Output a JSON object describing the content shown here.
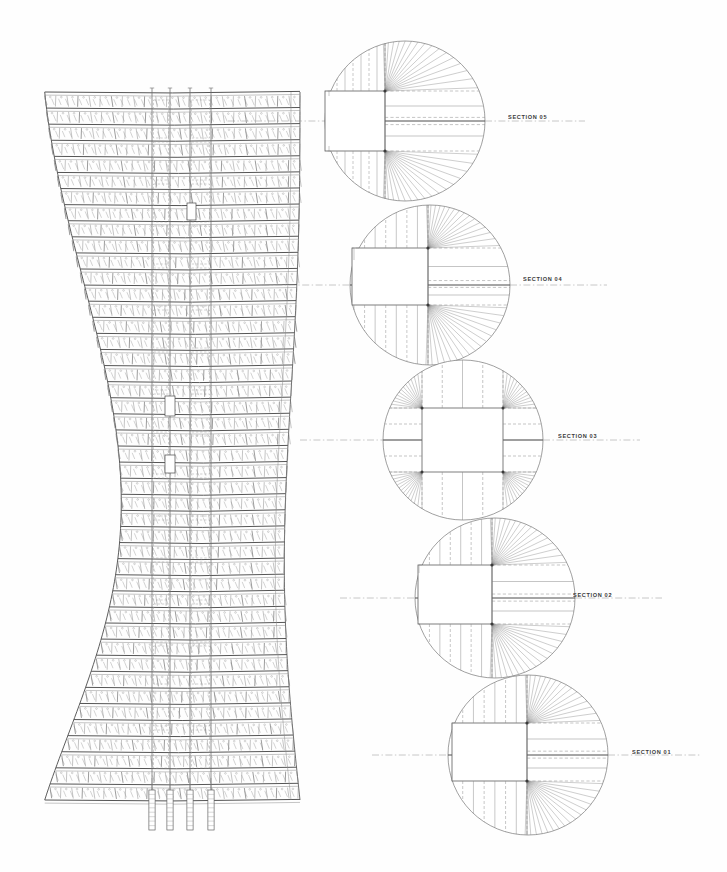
{
  "sheet": {
    "title": "Tower Structural Elevation and Floor Plan Sections",
    "background_color": "#fefefe",
    "ink_color": "#6e6e6e",
    "label_color": "#3a3a3a",
    "width": 727,
    "height": 872
  },
  "elevation": {
    "name": "Curved Tower Elevation",
    "left_edge_x": 40,
    "right_edge_x": 300,
    "top_y": 92,
    "bottom_y": 800,
    "floor_count": 45,
    "core_lines": [
      {
        "x": 152,
        "label_tick": true
      },
      {
        "x": 170,
        "label_tick": true
      },
      {
        "x": 190,
        "label_tick": true
      },
      {
        "x": 211,
        "label_tick": true
      }
    ],
    "core_tick_top_y": 790,
    "core_tick_bottom_y": 830,
    "profile_note": "S-curve facade, waist near mid-height"
  },
  "sections": [
    {
      "id": "section-05",
      "label": "SECTION 05",
      "cx": 405,
      "cy": 121,
      "r": 80,
      "label_x": 508,
      "label_y": 114,
      "centerline_x1": 228,
      "centerline_x2": 585,
      "type": "asymmetric",
      "nodes": [
        {
          "x": 385,
          "y": 91
        },
        {
          "x": 385,
          "y": 151
        }
      ],
      "core_rect": {
        "x1": 325,
        "y1": 91,
        "x2": 470,
        "y2": 151
      },
      "fan_count": 15
    },
    {
      "id": "section-04",
      "label": "SECTION 04",
      "cx": 430,
      "cy": 285,
      "r": 80,
      "label_x": 523,
      "label_y": 276,
      "centerline_x1": 262,
      "centerline_x2": 607,
      "type": "asymmetric",
      "nodes": [
        {
          "x": 428,
          "y": 248
        },
        {
          "x": 428,
          "y": 305
        }
      ],
      "core_rect": {
        "x1": 352,
        "y1": 248,
        "x2": 500,
        "y2": 305
      },
      "fan_count": 15
    },
    {
      "id": "section-03",
      "label": "SECTION 03",
      "cx": 463,
      "cy": 440,
      "r": 80,
      "label_x": 558,
      "label_y": 433,
      "centerline_x1": 300,
      "centerline_x2": 640,
      "type": "symmetric",
      "nodes": [
        {
          "x": 422,
          "y": 408
        },
        {
          "x": 503,
          "y": 408
        },
        {
          "x": 422,
          "y": 472
        },
        {
          "x": 503,
          "y": 472
        }
      ],
      "core_rect": {
        "x1": 422,
        "y1": 408,
        "x2": 503,
        "y2": 472
      },
      "fan_count": 13
    },
    {
      "id": "section-02",
      "label": "SECTION 02",
      "cx": 495,
      "cy": 598,
      "r": 80,
      "label_x": 573,
      "label_y": 592,
      "centerline_x1": 340,
      "centerline_x2": 662,
      "type": "asymmetric",
      "nodes": [
        {
          "x": 492,
          "y": 565
        },
        {
          "x": 492,
          "y": 624
        }
      ],
      "core_rect": {
        "x1": 418,
        "y1": 565,
        "x2": 565,
        "y2": 624
      },
      "fan_count": 15
    },
    {
      "id": "section-01",
      "label": "SECTION 01",
      "cx": 528,
      "cy": 755,
      "r": 80,
      "label_x": 632,
      "label_y": 749,
      "centerline_x1": 372,
      "centerline_x2": 700,
      "type": "asymmetric",
      "nodes": [
        {
          "x": 527,
          "y": 723
        },
        {
          "x": 527,
          "y": 781
        }
      ],
      "core_rect": {
        "x1": 452,
        "y1": 723,
        "x2": 600,
        "y2": 781
      },
      "fan_count": 15
    }
  ]
}
